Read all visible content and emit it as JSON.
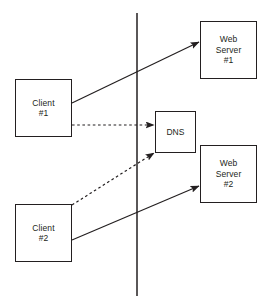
{
  "diagram": {
    "canvas": {
      "width": 270,
      "height": 308,
      "background": "#ffffff"
    },
    "stroke_color": "#231f20",
    "boundary_line": {
      "name": "network-boundary-line",
      "x": 137,
      "y_top": 13,
      "y_bottom": 296,
      "style": "solid"
    },
    "nodes": [
      {
        "id": "client-1",
        "lines": [
          "Client",
          "#1"
        ],
        "x": 15,
        "y": 79,
        "width": 57,
        "height": 58
      },
      {
        "id": "client-2",
        "lines": [
          "Client",
          "#2"
        ],
        "x": 15,
        "y": 204,
        "width": 57,
        "height": 58
      },
      {
        "id": "dns",
        "lines": [
          "DNS"
        ],
        "x": 155,
        "y": 111,
        "width": 41,
        "height": 42
      },
      {
        "id": "web-server-1",
        "lines": [
          "Web",
          "Server",
          "#1"
        ],
        "x": 200,
        "y": 21,
        "width": 57,
        "height": 58
      },
      {
        "id": "web-server-2",
        "lines": [
          "Web",
          "Server",
          "#2"
        ],
        "x": 200,
        "y": 145,
        "width": 57,
        "height": 58
      }
    ],
    "connections": [
      {
        "id": "client1-to-webserver1",
        "from": "client-1",
        "to": "web-server-1",
        "style": "solid",
        "x1": 72,
        "y1": 103,
        "x2": 199,
        "y2": 42
      },
      {
        "id": "client1-to-dns",
        "from": "client-1",
        "to": "dns",
        "style": "dashed",
        "x1": 72,
        "y1": 125,
        "x2": 154,
        "y2": 125
      },
      {
        "id": "client2-to-dns",
        "from": "client-2",
        "to": "dns",
        "style": "dashed",
        "x1": 72,
        "y1": 205,
        "x2": 154,
        "y2": 153
      },
      {
        "id": "client2-to-webserver2",
        "from": "client-2",
        "to": "web-server-2",
        "style": "solid",
        "x1": 72,
        "y1": 240,
        "x2": 199,
        "y2": 186
      }
    ]
  }
}
